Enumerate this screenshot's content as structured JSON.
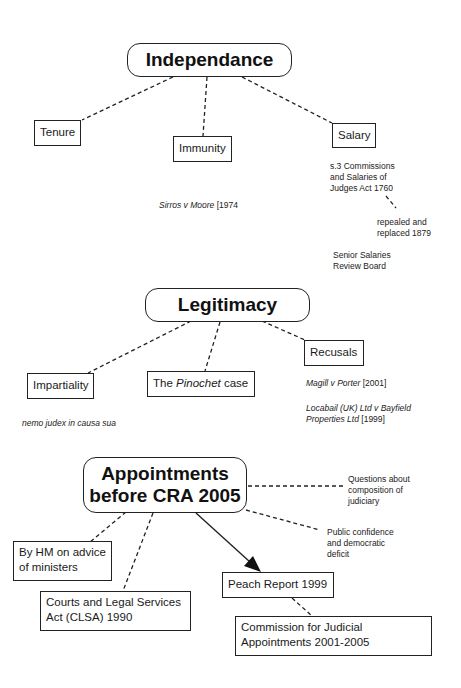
{
  "sections": {
    "independence": {
      "title": "Independance",
      "branches": {
        "tenure": "Tenure",
        "immunity": "Immunity",
        "salary": "Salary"
      },
      "immunity_case": {
        "name": "Sirros v Moore",
        "year": "[1974"
      },
      "salary_notes": {
        "act_line1": "s.3 Commissions",
        "act_line2": "and Salaries of",
        "act_line3": "Judges Act 1760",
        "repeal_line1": "repealed and",
        "repeal_line2": "replaced 1879",
        "board_line1": "Senior Salaries",
        "board_line2": "Review Board"
      }
    },
    "legitimacy": {
      "title": "Legitimacy",
      "branches": {
        "impartiality": "Impartiality",
        "pinochet_prefix": "The ",
        "pinochet_name": "Pinochet",
        "pinochet_suffix": " case",
        "recusals": "Recusals"
      },
      "impartiality_maxim": "nemo judex in causa sua",
      "recusal_cases": [
        {
          "name": "Magill v Porter",
          "year": "[2001]"
        },
        {
          "name_line1": "Locabail (UK) Ltd v Bayfield",
          "name_line2": "Properties Ltd",
          "year": "[1999]"
        }
      ]
    },
    "appointments": {
      "title_line1": "Appointments",
      "title_line2": "before CRA 2005",
      "branches": {
        "hm_line1": "By HM on advice",
        "hm_line2": "of ministers",
        "clsa_line1": "Courts and Legal Services",
        "clsa_line2": "Act (CLSA) 1990",
        "peach": "Peach Report 1999",
        "commission_line1": "Commission for Judicial",
        "commission_line2": "Appointments 2001-2005"
      },
      "notes": {
        "questions_line1": "Questions about",
        "questions_line2": "composition of",
        "questions_line3": "judiciary",
        "public_line1": "Public confidence",
        "public_line2": "and democratic",
        "public_line3": "deficit"
      }
    }
  },
  "colors": {
    "line": "#222222",
    "background": "#ffffff",
    "text": "#1a1a1a"
  }
}
